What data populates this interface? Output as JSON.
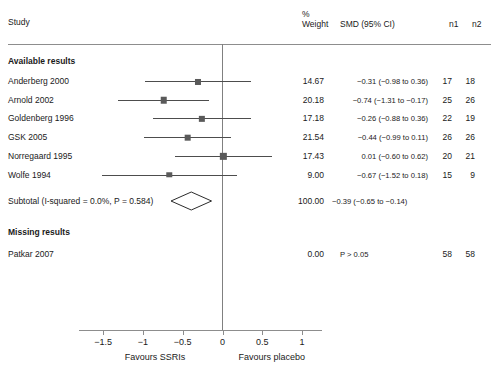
{
  "header": {
    "study_label": "Study",
    "percent_symbol": "%",
    "weight_label": "Weight",
    "smd_label": "SMD (95% CI)",
    "n1_label": "n1",
    "n2_label": "n2"
  },
  "groups": [
    {
      "title": "Available results"
    },
    {
      "title": "Missing results"
    }
  ],
  "axis": {
    "ticks": [
      "−1.5",
      "−1",
      "−0.5",
      "0",
      "0.5",
      "1"
    ],
    "tick_values": [
      -1.5,
      -1,
      -0.5,
      0,
      0.5,
      1
    ],
    "left_caption": "Favours SSRIs",
    "right_caption": "Favours placebo"
  },
  "subtotal": {
    "label": "Subtotal (I-squared = 0.0%, P = 0.584)",
    "weight": "100.00",
    "estimate": "−0.39 (−0.65 to −0.14)",
    "n1": "",
    "n2": ""
  },
  "missing_row": {
    "study": "Patkar 2007",
    "weight": "0.00",
    "estimate": "P > 0.05",
    "n1": "58",
    "n2": "58"
  },
  "chart_data": {
    "type": "forest",
    "title": "",
    "xlabel": "",
    "ylabel": "",
    "xlim": [
      -1.8,
      1.25
    ],
    "grid": false,
    "null_value": 0,
    "effect_measure": "SMD (95% CI)",
    "columns": [
      "Study",
      "% Weight",
      "SMD (95% CI)",
      "n1",
      "n2"
    ],
    "studies": [
      {
        "study": "Anderberg 2000",
        "weight": "14.67",
        "weight_value": 14.67,
        "estimate": -0.31,
        "ci_low": -0.98,
        "ci_high": 0.36,
        "estimate_text": "−0.31 (−0.98 to 0.36)",
        "n1": "17",
        "n2": "18"
      },
      {
        "study": "Arnold 2002",
        "weight": "20.18",
        "weight_value": 20.18,
        "estimate": -0.74,
        "ci_low": -1.31,
        "ci_high": -0.17,
        "estimate_text": "−0.74 (−1.31 to −0.17)",
        "n1": "25",
        "n2": "26"
      },
      {
        "study": "Goldenberg 1996",
        "weight": "17.18",
        "weight_value": 17.18,
        "estimate": -0.26,
        "ci_low": -0.88,
        "ci_high": 0.36,
        "estimate_text": "−0.26 (−0.88 to 0.36)",
        "n1": "22",
        "n2": "19"
      },
      {
        "study": "GSK 2005",
        "weight": "21.54",
        "weight_value": 21.54,
        "estimate": -0.44,
        "ci_low": -0.99,
        "ci_high": 0.11,
        "estimate_text": "−0.44 (−0.99 to 0.11)",
        "n1": "26",
        "n2": "26"
      },
      {
        "study": "Norregaard 1995",
        "weight": "17.43",
        "weight_value": 17.43,
        "estimate": 0.01,
        "ci_low": -0.6,
        "ci_high": 0.62,
        "estimate_text": "0.01 (−0.60 to 0.62)",
        "n1": "20",
        "n2": "21"
      },
      {
        "study": "Wolfe 1994",
        "weight": "9.00",
        "weight_value": 9.0,
        "estimate": -0.67,
        "ci_low": -1.52,
        "ci_high": 0.18,
        "estimate_text": "−0.67 (−1.52 to 0.18)",
        "n1": "15",
        "n2": "9"
      }
    ],
    "summary": {
      "label": "Subtotal (I-squared = 0.0%, P = 0.584)",
      "estimate": -0.39,
      "ci_low": -0.65,
      "ci_high": -0.14,
      "weight": 100.0
    },
    "missing": [
      {
        "study": "Patkar 2007",
        "weight": "0.00",
        "estimate_text": "P > 0.05",
        "n1": "58",
        "n2": "58"
      }
    ]
  },
  "colors": {
    "line": "#4d4d4d",
    "marker": "#5a5a5a",
    "axis": "#8d8d8d",
    "text": "#1a1a1a",
    "background": "#ffffff"
  }
}
